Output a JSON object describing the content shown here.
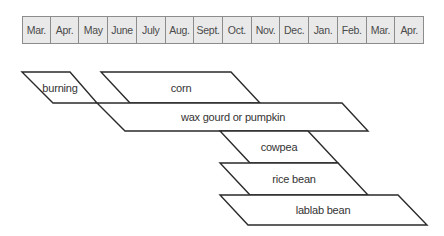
{
  "header": {
    "months": [
      "Mar.",
      "Apr.",
      "May",
      "June",
      "July",
      "Aug.",
      "Sept.",
      "Oct.",
      "Nov.",
      "Dec.",
      "Jan.",
      "Feb.",
      "Mar.",
      "Apr."
    ],
    "x_start": 22,
    "x_end": 424,
    "colors": {
      "background": "#e9e9e9",
      "border": "#8c8c8c",
      "text": "#4a4a4a"
    }
  },
  "crops": [
    {
      "label": "burning",
      "points": [
        [
          22,
          72
        ],
        [
          70,
          72
        ],
        [
          97,
          103
        ],
        [
          53,
          103
        ]
      ],
      "label_pos": [
        60,
        88
      ]
    },
    {
      "label": "corn",
      "points": [
        [
          101,
          72
        ],
        [
          231,
          72
        ],
        [
          260,
          103
        ],
        [
          130,
          103
        ]
      ],
      "label_pos": [
        181,
        88
      ]
    },
    {
      "label": "wax gourd or pumpkin",
      "points": [
        [
          97,
          103
        ],
        [
          342,
          103
        ],
        [
          368,
          131
        ],
        [
          125,
          131
        ]
      ],
      "label_pos": [
        233,
        117
      ]
    },
    {
      "label": "cowpea",
      "points": [
        [
          220,
          131
        ],
        [
          308,
          131
        ],
        [
          338,
          163
        ],
        [
          250,
          163
        ]
      ],
      "label_pos": [
        279,
        147
      ]
    },
    {
      "label": "rice bean",
      "points": [
        [
          220,
          163
        ],
        [
          338,
          163
        ],
        [
          368,
          195
        ],
        [
          250,
          195
        ]
      ],
      "label_pos": [
        294,
        179
      ]
    },
    {
      "label": "lablab bean",
      "points": [
        [
          220,
          195
        ],
        [
          398,
          195
        ],
        [
          427,
          225
        ],
        [
          248,
          225
        ]
      ],
      "label_pos": [
        323,
        210
      ]
    }
  ]
}
